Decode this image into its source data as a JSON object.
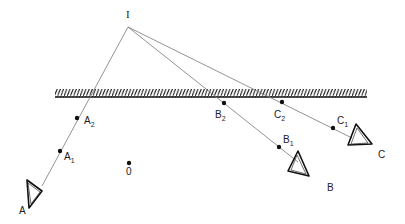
{
  "diagram": {
    "type": "ray-reflection-geometry",
    "source": {
      "label": "I",
      "x": 128,
      "y": 27
    },
    "mirror": {
      "x1": 55,
      "x2": 367,
      "y": 97,
      "hatch_height": 8
    },
    "origin": {
      "label": "0",
      "x": 129,
      "y": 163
    },
    "rays": [
      {
        "name": "A",
        "label": "A",
        "end": {
          "x": 42,
          "y": 186
        },
        "observer": {
          "x": 30,
          "y": 190
        },
        "label_pos": {
          "x": 19,
          "y": 214
        },
        "points": [
          {
            "label": "A",
            "sub": "2",
            "x": 77,
            "y": 118,
            "lx": 84,
            "ly": 124
          },
          {
            "label": "A",
            "sub": "1",
            "x": 60,
            "y": 151,
            "lx": 64,
            "ly": 160
          }
        ]
      },
      {
        "name": "B",
        "label": "B",
        "end": {
          "x": 298,
          "y": 162
        },
        "observer": {
          "x": 298,
          "y": 165
        },
        "label_pos": {
          "x": 327,
          "y": 191
        },
        "points": [
          {
            "label": "B",
            "sub": "2",
            "x": 224,
            "y": 103,
            "lx": 215,
            "ly": 118
          },
          {
            "label": "B",
            "sub": "1",
            "x": 279,
            "y": 147,
            "lx": 283,
            "ly": 143
          }
        ]
      },
      {
        "name": "C",
        "label": "C",
        "end": {
          "x": 352,
          "y": 138
        },
        "observer": {
          "x": 358,
          "y": 140
        },
        "label_pos": {
          "x": 378,
          "y": 158
        },
        "points": [
          {
            "label": "C",
            "sub": "2",
            "x": 282,
            "y": 102,
            "lx": 274,
            "ly": 118
          },
          {
            "label": "C",
            "sub": "1",
            "x": 333,
            "y": 128,
            "lx": 337,
            "ly": 124
          }
        ]
      }
    ],
    "colors": {
      "line": "#777777",
      "ink": "#111111",
      "background": "#ffffff"
    }
  }
}
